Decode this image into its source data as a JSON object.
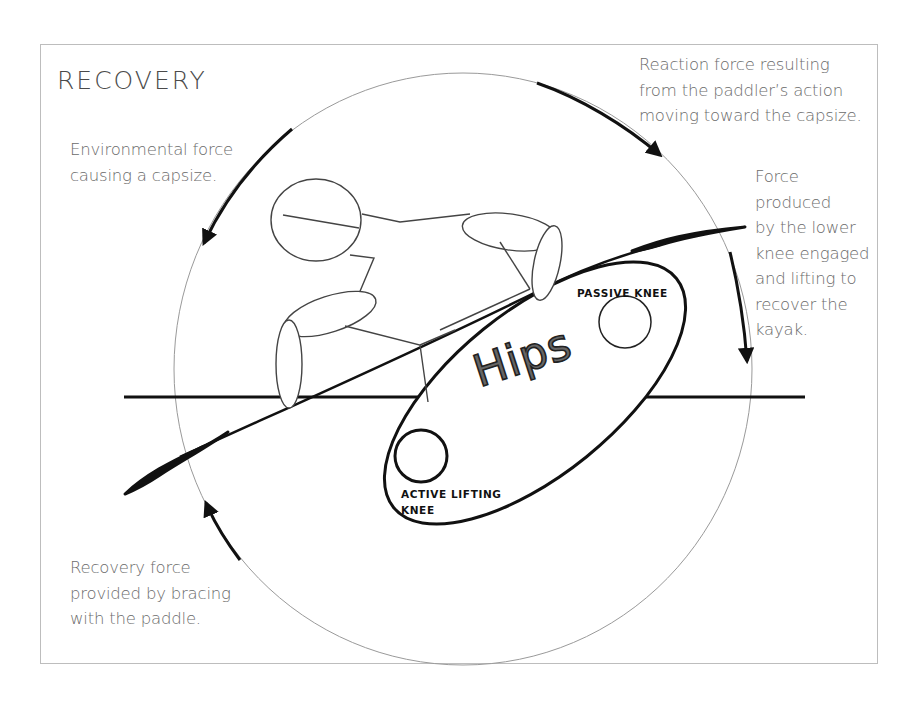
{
  "title": "RECOVERY",
  "labels": {
    "environmental_force": [
      "Environmental force",
      "causing a capsize."
    ],
    "reaction_force": [
      "Reaction force resulting",
      "from the paddler’s action",
      "moving toward the capsize."
    ],
    "knee_force": [
      "Force",
      "produced",
      "by the lower",
      "knee engaged",
      "and lifting to",
      "recover the",
      "kayak."
    ],
    "recovery_force": [
      "Recovery force",
      "provided by bracing",
      "with the paddle."
    ]
  },
  "body_parts": {
    "hips": "Hips",
    "passive_knee": "PASSIVE KNEE",
    "active_knee": [
      "ACTIVE LIFTING",
      "KNEE"
    ]
  },
  "arrows": [
    {
      "id": "environmental",
      "direction": "counter-clockwise",
      "position": "upper-left",
      "icon": "arrow-down-left"
    },
    {
      "id": "reaction",
      "direction": "clockwise",
      "position": "upper-right",
      "icon": "arrow-down-right"
    },
    {
      "id": "knee_lift",
      "direction": "clockwise",
      "position": "right",
      "icon": "arrow-down"
    },
    {
      "id": "bracing",
      "direction": "clockwise",
      "position": "lower-left",
      "icon": "arrow-up-left"
    }
  ],
  "colors": {
    "frame": "#bdbdbd",
    "circle": "#9a9a9a",
    "ink": "#111111",
    "figure": "#444444",
    "text": "#6b6b6b"
  }
}
